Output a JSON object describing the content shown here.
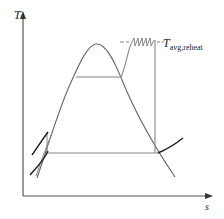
{
  "diagram": {
    "type": "T-s diagram",
    "axes": {
      "y_label": "T",
      "x_label": "s"
    },
    "annotation": {
      "symbol": "T",
      "subscript": "avg,reheat"
    },
    "colors": {
      "axis": "#555555",
      "dome": "#666666",
      "cycle": "#888888",
      "heavy_curve": "#222222"
    }
  }
}
